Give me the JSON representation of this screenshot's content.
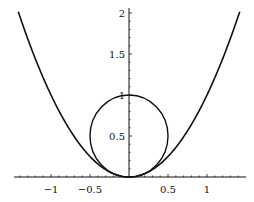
{
  "chart_data": {
    "type": "line",
    "title": "",
    "xlabel": "",
    "ylabel": "",
    "xlim": [
      -1.4,
      1.4
    ],
    "ylim": [
      0,
      2
    ],
    "grid": false,
    "x_ticks": [
      "-1",
      "-0.5",
      "0.5",
      "1"
    ],
    "y_ticks": [
      "0.5",
      "1",
      "1.5",
      "2"
    ],
    "series": [
      {
        "name": "parabola y = x^2",
        "x": [
          -1.4,
          -1.2,
          -1,
          -0.8,
          -0.6,
          -0.4,
          -0.2,
          0,
          0.2,
          0.4,
          0.6,
          0.8,
          1,
          1.2,
          1.4
        ],
        "y": [
          1.96,
          1.44,
          1,
          0.64,
          0.36,
          0.16,
          0.04,
          0,
          0.04,
          0.16,
          0.36,
          0.64,
          1,
          1.44,
          1.96
        ]
      },
      {
        "name": "circle x^2 + (y-0.5)^2 = 0.25",
        "center": [
          0,
          0.5
        ],
        "radius": 0.5
      }
    ]
  }
}
